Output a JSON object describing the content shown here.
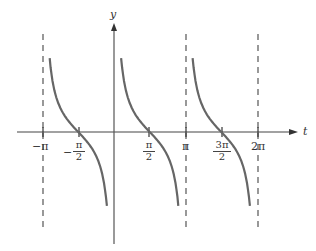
{
  "chart_data": {
    "type": "line",
    "title": "",
    "function": "y = cot(t)",
    "xlabel": "t",
    "ylabel": "y",
    "x_ticks": [
      {
        "value": -3.14159,
        "label": "−π"
      },
      {
        "value": -1.5708,
        "label": "−π/2",
        "sign": "−",
        "num": "π",
        "den": "2"
      },
      {
        "value": 1.5708,
        "label": "π/2",
        "num": "π",
        "den": "2"
      },
      {
        "value": 3.14159,
        "label": "π"
      },
      {
        "value": 4.71239,
        "label": "3π/2",
        "num": "3π",
        "den": "2"
      },
      {
        "value": 6.28319,
        "label": "2π"
      }
    ],
    "asymptotes": [
      -3.14159,
      0,
      3.14159,
      6.28319
    ],
    "branches": [
      {
        "from": -3.14159,
        "to": 0,
        "zero": -1.5708
      },
      {
        "from": 0,
        "to": 3.14159,
        "zero": 1.5708
      },
      {
        "from": 3.14159,
        "to": 6.28319,
        "zero": 4.71239
      }
    ],
    "grid": false,
    "legend": null
  },
  "labels": {
    "t_axis": "t",
    "y_axis": "y",
    "neg_pi": "−π",
    "neg_sign": "−",
    "pi": "π",
    "three_pi": "3π",
    "two": "2",
    "two_pi": "2π"
  }
}
